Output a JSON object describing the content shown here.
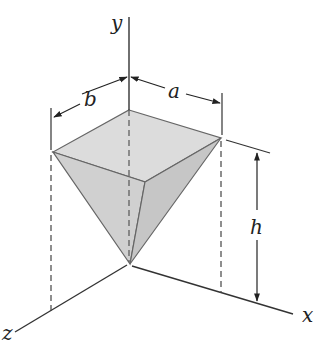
{
  "figure": {
    "axes": {
      "x_label": "x",
      "y_label": "y",
      "z_label": "z"
    },
    "dimensions": {
      "a_label": "a",
      "b_label": "b",
      "h_label": "h"
    },
    "colors": {
      "face_top": "#dcdcdc",
      "face_left": "#cfcfcf",
      "face_right": "#c4c4c4",
      "line": "#333333"
    }
  }
}
